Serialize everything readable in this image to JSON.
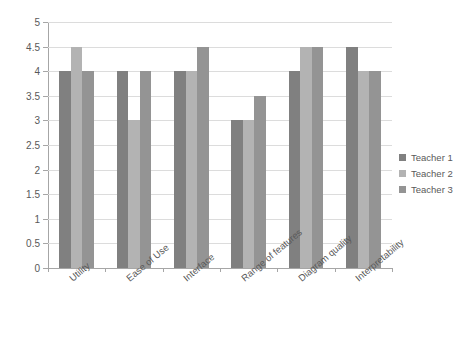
{
  "chart_data": {
    "type": "bar",
    "title": "",
    "subtitle": "",
    "xlabel": "",
    "ylabel": "",
    "categories": [
      "Utility",
      "Ease of Use",
      "Interface",
      "Range of features",
      "Diagram quality",
      "Interpretability"
    ],
    "series": [
      {
        "name": "Teacher 1",
        "color": "#808080",
        "values": [
          4,
          4,
          4,
          3,
          4,
          4.5
        ]
      },
      {
        "name": "Teacher 2",
        "color": "#b3b3b3",
        "values": [
          4.5,
          3,
          4,
          3,
          4.5,
          4
        ]
      },
      {
        "name": "Teacher 3",
        "color": "#949494",
        "values": [
          4,
          4,
          4.5,
          3.5,
          4.5,
          4
        ]
      }
    ],
    "ylim": [
      0,
      5
    ],
    "ytick_labels": [
      "0",
      "0.5",
      "1",
      "1.5",
      "2",
      "2.5",
      "3",
      "3.5",
      "4",
      "4.5",
      "5"
    ],
    "ytick_values": [
      0,
      0.5,
      1,
      1.5,
      2,
      2.5,
      3,
      3.5,
      4,
      4.5,
      5
    ],
    "grid": true,
    "grid_axis": "y",
    "legend_position": "right",
    "legend": [
      "Teacher 1",
      "Teacher 2",
      "Teacher 3"
    ],
    "annotations": []
  },
  "colors": {
    "series_1": "#808080",
    "series_2": "#b3b3b3",
    "series_3": "#949494",
    "axis": "#a6a6a6",
    "gridline": "#dcdcdc",
    "text": "#595959",
    "background": "#ffffff"
  }
}
